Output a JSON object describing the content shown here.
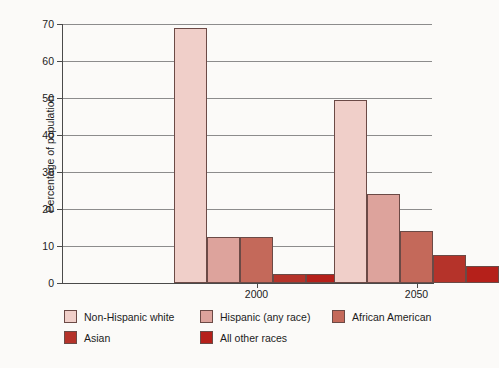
{
  "chart_data": {
    "type": "bar",
    "title": "",
    "xlabel": "",
    "ylabel": "Percentage of population",
    "ylim": [
      0,
      70
    ],
    "ytick_step": 10,
    "yticks": [
      "0",
      "10",
      "20",
      "30",
      "40",
      "50",
      "60",
      "70"
    ],
    "categories": [
      "2000",
      "2050"
    ],
    "grid": "horizontal",
    "legend_position": "below-axes",
    "series": [
      {
        "name": "Non-Hispanic white",
        "color": "#f0cfc9",
        "values": [
          69,
          49.5
        ]
      },
      {
        "name": "Hispanic (any race)",
        "color": "#dda39c",
        "values": [
          12.5,
          24
        ]
      },
      {
        "name": "African  American",
        "color": "#c4695a",
        "values": [
          12.5,
          14
        ]
      },
      {
        "name": "Asian",
        "color": "#b5332a",
        "values": [
          2.5,
          7.5
        ]
      },
      {
        "name": "All other races",
        "color": "#b5201a",
        "values": [
          2.5,
          4.5
        ]
      }
    ]
  },
  "axes": {
    "y_label": "Percentage of population"
  }
}
